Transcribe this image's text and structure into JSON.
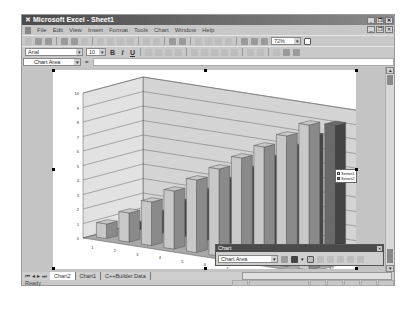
{
  "window": {
    "title": "Microsoft Excel - Sheet1",
    "controls": [
      "minimize",
      "restore",
      "close"
    ]
  },
  "menubar": {
    "items": [
      "File",
      "Edit",
      "View",
      "Insert",
      "Format",
      "Tools",
      "Chart",
      "Window",
      "Help"
    ]
  },
  "standard_toolbar": {
    "zoom": "72%"
  },
  "format_toolbar": {
    "font": "Arial",
    "size": "10",
    "bold": "B",
    "italic": "I",
    "underline": "U"
  },
  "namebox": {
    "value": "Chart Area"
  },
  "chart_toolbar": {
    "title": "Chart",
    "selector": "Chart Area"
  },
  "sheet_tabs": {
    "tabs": [
      "Chart2",
      "Chart1",
      "C++Builder Data"
    ],
    "active": "Chart2"
  },
  "status": {
    "text": "Ready"
  },
  "chart_data": {
    "type": "bar",
    "subtype": "3d-column",
    "categories": [
      "1",
      "2",
      "3",
      "4",
      "5",
      "6",
      "7",
      "8",
      "9",
      "10"
    ],
    "series": [
      {
        "name": "Series1",
        "values": [
          1,
          2,
          3,
          4,
          5,
          6,
          7,
          8,
          9,
          10
        ],
        "color": "#c8c8c8"
      },
      {
        "name": "Series2",
        "values": [
          0.5,
          1.5,
          2.5,
          3.5,
          4.5,
          5.5,
          6.5,
          7.5,
          8.5,
          9.5
        ],
        "color": "#6a6a6a"
      }
    ],
    "depth_labels": [
      "S1",
      "S2"
    ],
    "yticks": [
      "0",
      "1",
      "2",
      "3",
      "4",
      "5",
      "6",
      "7",
      "8",
      "9",
      "10"
    ],
    "ylim": [
      0,
      10
    ],
    "grid": true,
    "legend_position": "right",
    "title": "",
    "xlabel": "",
    "ylabel": ""
  }
}
